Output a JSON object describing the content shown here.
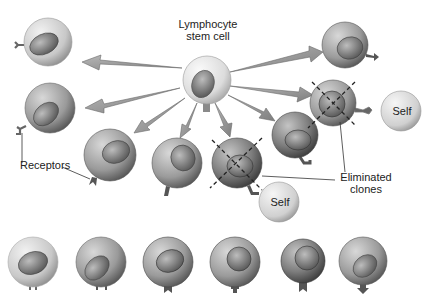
{
  "diagram": {
    "labels": {
      "stem_cell_line1": "Lymphocyte",
      "stem_cell_line2": "stem cell",
      "receptors": "Receptors",
      "eliminated_line1": "Eliminated",
      "eliminated_line2": "clones",
      "self_right": "Self",
      "self_bottom": "Self"
    },
    "colors": {
      "background": "#ffffff",
      "stem_cell": "#e4e4e4",
      "light_cell": "#cfcfcf",
      "mid_cell": "#9a9a9a",
      "dark_cell": "#7a7a7a",
      "arrow": "#9c9c9c",
      "self_sphere": "#d6d6d6"
    },
    "stem_cell": {
      "cx": 207,
      "cy": 80,
      "r": 24
    },
    "clones": [
      {
        "id": "clone-top-left",
        "cx": 48,
        "cy": 42,
        "r": 24,
        "shade": "light",
        "receptor": "y-fork-left"
      },
      {
        "id": "clone-mid-left",
        "cx": 48,
        "cy": 108,
        "r": 25,
        "shade": "mid",
        "receptor": "fork-left"
      },
      {
        "id": "clone-row2-1",
        "cx": 110,
        "cy": 155,
        "r": 26,
        "shade": "mid",
        "receptor": "notch-bottom"
      },
      {
        "id": "clone-row2-2",
        "cx": 177,
        "cy": 163,
        "r": 25,
        "shade": "mid",
        "receptor": "stem-bottom"
      },
      {
        "id": "clone-row2-3",
        "cx": 237,
        "cy": 163,
        "r": 25,
        "shade": "dark",
        "receptor": "stem-bottom",
        "eliminated": true
      },
      {
        "id": "clone-row2-4",
        "cx": 295,
        "cy": 135,
        "r": 23,
        "shade": "dark",
        "receptor": "knob-right"
      },
      {
        "id": "clone-top-right",
        "cx": 345,
        "cy": 45,
        "r": 23,
        "shade": "mid",
        "receptor": "arrow-right"
      },
      {
        "id": "clone-mid-right",
        "cx": 333,
        "cy": 103,
        "r": 23,
        "shade": "mid",
        "receptor": "knob-right",
        "eliminated": true
      }
    ],
    "bottom_row": [
      {
        "cx": 33,
        "cy": 262,
        "r": 25,
        "shade": "light",
        "receptor": "y-fork"
      },
      {
        "cx": 101,
        "cy": 262,
        "r": 25,
        "shade": "mid",
        "receptor": "fork"
      },
      {
        "cx": 168,
        "cy": 262,
        "r": 25,
        "shade": "mid",
        "receptor": "notch"
      },
      {
        "cx": 235,
        "cy": 262,
        "r": 25,
        "shade": "mid",
        "receptor": "stem"
      },
      {
        "cx": 303,
        "cy": 262,
        "r": 22,
        "shade": "dark",
        "receptor": "notch"
      },
      {
        "cx": 363,
        "cy": 262,
        "r": 24,
        "shade": "mid",
        "receptor": "arrow-down"
      }
    ],
    "self_spheres": [
      {
        "id": "self-right",
        "cx": 401,
        "cy": 111,
        "r": 20
      },
      {
        "id": "self-bottom",
        "cx": 279,
        "cy": 202,
        "r": 20
      }
    ]
  }
}
